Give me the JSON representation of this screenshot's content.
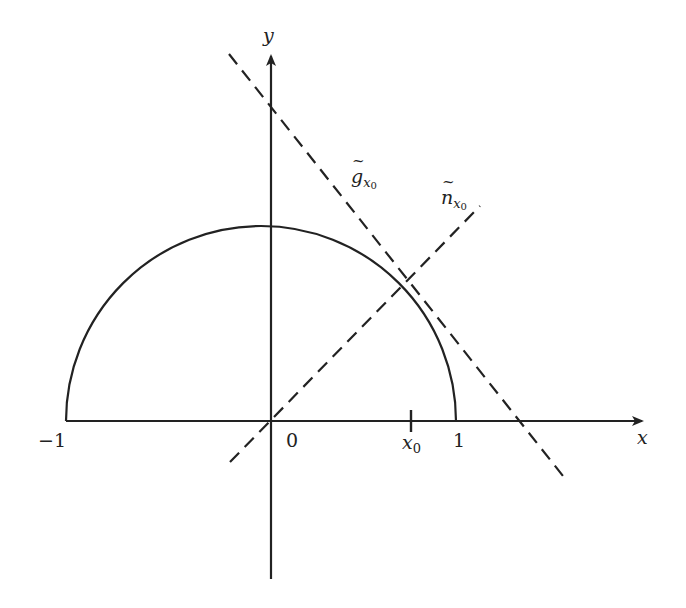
{
  "figure": {
    "stroke_color": "#222222",
    "background": "#ffffff"
  },
  "axes": {
    "x_label": "x",
    "y_label": "y",
    "origin_label": "0",
    "neg_one_label": "−1",
    "one_label": "1",
    "x0_label": "x",
    "x0_sub": "0"
  },
  "curves": {
    "semicircle": {
      "center": [
        0,
        0
      ],
      "radius": 1,
      "range": "upper half"
    },
    "tangent_line": {
      "label": "g",
      "subscript": "x",
      "subsubscript": "0",
      "style": "dashed"
    },
    "normal_line": {
      "label": "n",
      "subscript": "x",
      "subsubscript": "0",
      "style": "dashed"
    }
  }
}
